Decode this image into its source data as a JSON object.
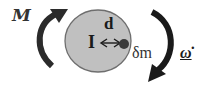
{
  "diagram": {
    "labels": {
      "moment": "M",
      "inertia": "I",
      "distance": "d",
      "mass_element": "δm",
      "angular_acceleration": "ω̇"
    },
    "colors": {
      "disk_fill": "#c0c0c0",
      "disk_stroke": "#6e6e6e",
      "arrow": "#2b2b2b",
      "mass_dot": "#3a3a3a",
      "background": "#ffffff"
    },
    "shapes": {
      "disk": {
        "cx": 98,
        "cy": 41,
        "rx": 33,
        "ry": 31
      },
      "mass_dot": {
        "cx": 124,
        "cy": 44,
        "r": 5
      }
    }
  }
}
